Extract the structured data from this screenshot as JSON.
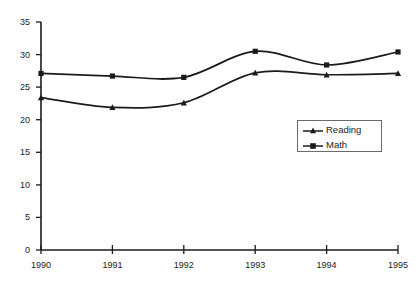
{
  "chart_data": {
    "type": "line",
    "title": "",
    "subtitle": "",
    "xlabel": "",
    "ylabel": "",
    "categories": [
      "1990",
      "1991",
      "1992",
      "1993",
      "1994",
      "1995"
    ],
    "x": [
      1990,
      1991,
      1992,
      1993,
      1994,
      1995
    ],
    "series": [
      {
        "name": "Reading",
        "marker": "triangle",
        "color": "#1b1b1b",
        "values": [
          23.4,
          21.9,
          22.6,
          27.2,
          26.9,
          27.1
        ]
      },
      {
        "name": "Math",
        "marker": "square",
        "color": "#1b1b1b",
        "values": [
          27.1,
          26.7,
          26.5,
          30.5,
          28.4,
          30.4
        ]
      }
    ],
    "ylim": [
      0,
      35
    ],
    "ytick_values": [
      0,
      5,
      10,
      15,
      20,
      25,
      30,
      35
    ],
    "ytick_labels": [
      "0",
      "5",
      "10",
      "15",
      "20",
      "25",
      "30",
      "35"
    ],
    "xtick_labels": [
      "1990",
      "1991",
      "1992",
      "1993",
      "1994",
      "1995"
    ],
    "grid": false,
    "legend_position": "center-right",
    "legend_entries": [
      "Reading",
      "Math"
    ],
    "line_style": "smoothed",
    "axis_color": "#1b1b1b",
    "background_color": "#ffffff"
  },
  "legend": {
    "items": [
      {
        "label": "Reading",
        "marker": "triangle-marker-icon"
      },
      {
        "label": "Math",
        "marker": "square-marker-icon"
      }
    ]
  },
  "axes": {
    "y": {
      "labels": [
        "35",
        "30",
        "25",
        "20",
        "15",
        "10",
        "5",
        "0"
      ]
    },
    "x": {
      "labels": [
        "1990",
        "1991",
        "1992",
        "1993",
        "1994",
        "1995"
      ]
    }
  }
}
